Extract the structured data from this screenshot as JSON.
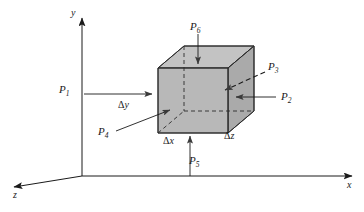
{
  "figure": {
    "kind": "3d-control-volume-diagram",
    "background_color": "#ffffff",
    "line_color": "#1a1a1a",
    "face_front_color": "#b7b7b7",
    "face_right_color": "#a8a8a8",
    "face_top_color": "#c2c2c2"
  },
  "axes": {
    "y_label": "y",
    "x_label": "x",
    "z_label": "z"
  },
  "forces": [
    {
      "id": "P1",
      "base": "P",
      "sub": "1",
      "label": "P₁",
      "direction": "right"
    },
    {
      "id": "P2",
      "base": "P",
      "sub": "2",
      "label": "P₂",
      "direction": "left"
    },
    {
      "id": "P3",
      "base": "P",
      "sub": "3",
      "label": "P₃",
      "direction": "down-left"
    },
    {
      "id": "P4",
      "base": "P",
      "sub": "4",
      "label": "P₄",
      "direction": "up-right"
    },
    {
      "id": "P5",
      "base": "P",
      "sub": "5",
      "label": "P₅",
      "direction": "up"
    },
    {
      "id": "P6",
      "base": "P",
      "sub": "6",
      "label": "P₆",
      "direction": "down"
    }
  ],
  "dimensions": [
    {
      "id": "dx",
      "delta": "Δ",
      "var": "x",
      "label": "Δx"
    },
    {
      "id": "dy",
      "delta": "Δ",
      "var": "y",
      "label": "Δy"
    },
    {
      "id": "dz",
      "delta": "Δ",
      "var": "z",
      "label": "Δz"
    }
  ]
}
